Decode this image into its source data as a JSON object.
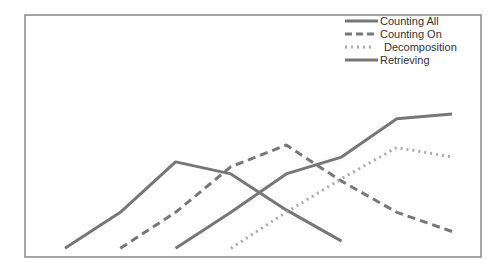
{
  "chart_data": {
    "type": "line",
    "title": "",
    "xlabel": "",
    "ylabel": "",
    "grid": false,
    "legend_position": "top-right",
    "x": [
      1,
      2,
      3,
      4,
      5,
      6,
      7,
      8
    ],
    "ylim": [
      0,
      100
    ],
    "series": [
      {
        "name": "Counting All",
        "style": "solid",
        "color": "#777777",
        "values": [
          3,
          18,
          39,
          34,
          19,
          6,
          null,
          null
        ]
      },
      {
        "name": "Counting On",
        "style": "dashed",
        "color": "#777777",
        "values": [
          null,
          3,
          18,
          37,
          46,
          31,
          18,
          10
        ]
      },
      {
        "name": "Decomposition",
        "style": "dotted",
        "color": "#aaaaaa",
        "values": [
          null,
          null,
          null,
          3,
          18,
          32,
          45,
          41
        ]
      },
      {
        "name": "Retrieving",
        "style": "solid",
        "color": "#777777",
        "values": [
          null,
          null,
          3,
          18,
          34,
          41,
          57,
          59
        ]
      }
    ]
  },
  "legend": {
    "items": [
      {
        "label": "Counting All",
        "style": "solid"
      },
      {
        "label": "Counting On",
        "style": "dashed"
      },
      {
        "label": "Decomposition",
        "style": "dotted"
      },
      {
        "label": "Retrieving",
        "style": "solid"
      }
    ]
  }
}
